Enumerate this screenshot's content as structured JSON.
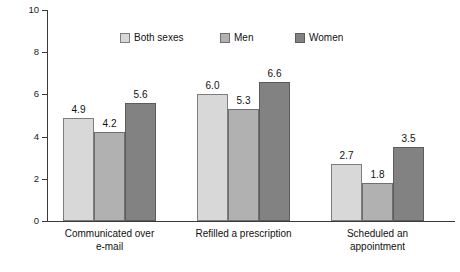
{
  "chart_data": {
    "type": "bar",
    "title": "",
    "subtitle": "",
    "xlabel": "",
    "ylabel": "Percent",
    "ylim": [
      0,
      10
    ],
    "yticks": [
      0,
      2,
      4,
      6,
      8,
      10
    ],
    "ytick_labels": [
      "0",
      "2",
      "4",
      "6",
      "8",
      "10"
    ],
    "grid": false,
    "legend_position": "top-center",
    "categories": [
      "Communicated over e-mail",
      "Refilled a prescription",
      "Scheduled an appointment"
    ],
    "category_lines": [
      [
        "Communicated over",
        "e-mail"
      ],
      [
        "Refilled a prescription",
        ""
      ],
      [
        "Scheduled an",
        "appointment"
      ]
    ],
    "series": [
      {
        "name": "Both sexes",
        "color": "#d8d8d8",
        "values": [
          4.9,
          6.0,
          2.7
        ],
        "labels": [
          "4.9",
          "6.0",
          "2.7"
        ]
      },
      {
        "name": "Men",
        "color": "#b1b1b1",
        "values": [
          4.2,
          5.3,
          1.8
        ],
        "labels": [
          "4.2",
          "5.3",
          "1.8"
        ]
      },
      {
        "name": "Women",
        "color": "#828282",
        "values": [
          5.6,
          6.6,
          3.5
        ],
        "labels": [
          "5.6",
          "6.6",
          "3.5"
        ]
      }
    ]
  },
  "legend": {
    "items": [
      {
        "label": "Both sexes"
      },
      {
        "label": "Men"
      },
      {
        "label": "Women"
      }
    ]
  },
  "axis": {
    "y_title": "Percent"
  },
  "footer": {
    "caption_fragment": ""
  }
}
